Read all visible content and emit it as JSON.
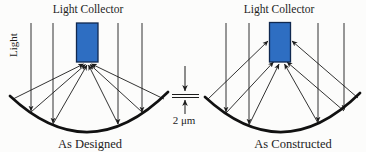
{
  "figure": {
    "left_panel": {
      "title": "Light Collector",
      "side_label": "Light",
      "caption": "As Designed"
    },
    "right_panel": {
      "title": "Light Collector",
      "caption": "As Constructed"
    },
    "dimension": {
      "label": "2 μm"
    },
    "colors": {
      "collector_fill": "#2e6ec2",
      "line": "#1c1c1c",
      "background": "#fcfcfb"
    }
  }
}
